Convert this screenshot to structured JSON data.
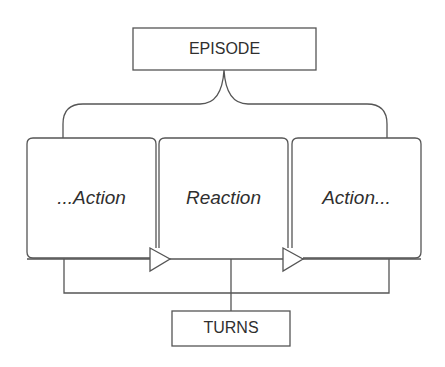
{
  "diagram": {
    "top_node": {
      "label": "EPISODE"
    },
    "bottom_node": {
      "label": "TURNS"
    },
    "sequence": [
      {
        "label": "...Action"
      },
      {
        "label": "Reaction"
      },
      {
        "label": "Action..."
      }
    ],
    "colors": {
      "line": "#555555",
      "text": "#2f2f2f",
      "background": "#ffffff"
    }
  }
}
